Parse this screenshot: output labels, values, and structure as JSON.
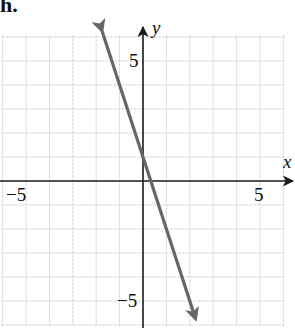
{
  "part_label": "h.",
  "chart_data": {
    "type": "line",
    "title": "",
    "xlabel": "x",
    "ylabel": "y",
    "xlim": [
      -6,
      6
    ],
    "ylim": [
      -6,
      6
    ],
    "grid": true,
    "grid_step": 1,
    "x_tick_labels": [
      {
        "value": -5,
        "label": "−5"
      },
      {
        "value": 5,
        "label": "5"
      }
    ],
    "y_tick_labels": [
      {
        "value": 5,
        "label": "5"
      },
      {
        "value": -5,
        "label": "−5"
      }
    ],
    "series": [
      {
        "name": "line",
        "equation": "y = -3x + 1",
        "slope": -3,
        "intercept": 1,
        "x": [
          -1.75,
          2.25
        ],
        "y": [
          6.25,
          -5.75
        ],
        "arrows": "both",
        "color": "#666666"
      }
    ],
    "legend": null
  },
  "colors": {
    "grid": "#d4d4d4",
    "axis": "#1a1a1a",
    "line": "#666666"
  }
}
